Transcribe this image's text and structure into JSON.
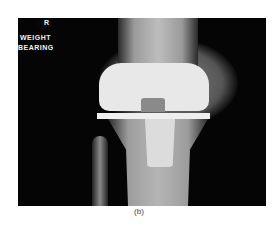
{
  "image": {
    "description": "Knee X-ray showing total knee replacement prosthesis, weight bearing view",
    "overlay_labels": {
      "side": "R",
      "line1": "WEIGHT",
      "line2": "BEARING"
    }
  },
  "caption": "(b)"
}
